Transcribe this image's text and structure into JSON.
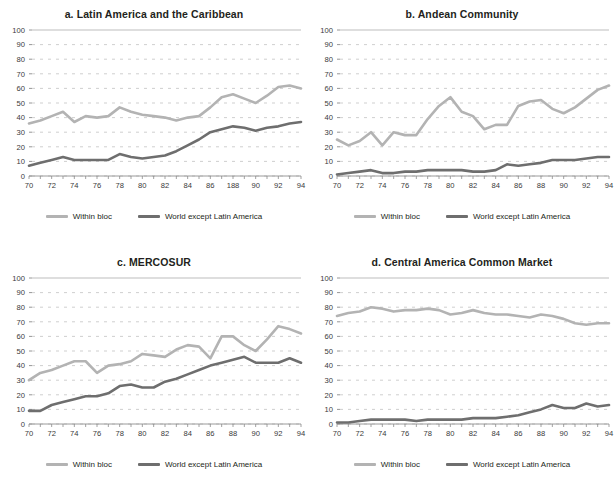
{
  "figure": {
    "background": "#ffffff",
    "series_colors": {
      "within_bloc": "#b3b3b3",
      "world_except": "#6e6e6e"
    },
    "grid_color": "#c9c9c9",
    "axis_color": "#9a9a9a",
    "legend": {
      "within_bloc_label": "Within bloc",
      "world_except_label": "World except Latin America"
    },
    "x_tick_labels": [
      "70",
      "72",
      "74",
      "76",
      "78",
      "80",
      "82",
      "84",
      "86",
      "188",
      "90",
      "92",
      "94"
    ],
    "x_tick_labels_standard": [
      "70",
      "72",
      "74",
      "76",
      "78",
      "80",
      "82",
      "84",
      "86",
      "88",
      "90",
      "92",
      "94"
    ],
    "y_tick_labels": [
      "0",
      "10",
      "20",
      "30",
      "40",
      "50",
      "60",
      "70",
      "80",
      "90",
      "100"
    ]
  },
  "chart_data": [
    {
      "id": "a",
      "type": "line",
      "title": "a. Latin America and the Caribbean",
      "xlabel": "",
      "ylabel": "",
      "xlim": [
        70,
        94
      ],
      "ylim": [
        0,
        100
      ],
      "grid": true,
      "legend_position": "bottom",
      "x": [
        70,
        71,
        72,
        73,
        74,
        75,
        76,
        77,
        78,
        79,
        80,
        81,
        82,
        83,
        84,
        85,
        86,
        87,
        88,
        89,
        90,
        91,
        92,
        93,
        94
      ],
      "tick_labels": [
        "70",
        "72",
        "74",
        "76",
        "78",
        "80",
        "82",
        "84",
        "86",
        "188",
        "90",
        "92",
        "94"
      ],
      "series": [
        {
          "name": "Within bloc",
          "color": "#b3b3b3",
          "values": [
            36,
            38,
            41,
            44,
            37,
            41,
            40,
            41,
            47,
            44,
            42,
            41,
            40,
            38,
            40,
            41,
            47,
            54,
            56,
            53,
            50,
            55,
            61,
            62,
            60
          ]
        },
        {
          "name": "World except Latin America",
          "color": "#6e6e6e",
          "values": [
            7,
            9,
            11,
            13,
            11,
            11,
            11,
            11,
            15,
            13,
            12,
            13,
            14,
            17,
            21,
            25,
            30,
            32,
            34,
            33,
            31,
            33,
            34,
            36,
            37
          ]
        }
      ]
    },
    {
      "id": "b",
      "type": "line",
      "title": "b. Andean Community",
      "xlabel": "",
      "ylabel": "",
      "xlim": [
        70,
        94
      ],
      "ylim": [
        0,
        100
      ],
      "grid": true,
      "legend_position": "bottom",
      "x": [
        70,
        71,
        72,
        73,
        74,
        75,
        76,
        77,
        78,
        79,
        80,
        81,
        82,
        83,
        84,
        85,
        86,
        87,
        88,
        89,
        90,
        91,
        92,
        93,
        94
      ],
      "tick_labels": [
        "70",
        "72",
        "74",
        "76",
        "78",
        "80",
        "82",
        "84",
        "86",
        "88",
        "90",
        "92",
        "94"
      ],
      "series": [
        {
          "name": "Within bloc",
          "color": "#b3b3b3",
          "values": [
            25,
            21,
            24,
            30,
            21,
            30,
            28,
            28,
            39,
            48,
            54,
            44,
            41,
            32,
            35,
            35,
            48,
            51,
            52,
            46,
            43,
            47,
            53,
            59,
            62
          ]
        },
        {
          "name": "World except Latin America",
          "color": "#6e6e6e",
          "values": [
            1,
            2,
            3,
            4,
            2,
            2,
            3,
            3,
            4,
            4,
            4,
            4,
            3,
            3,
            4,
            8,
            7,
            8,
            9,
            11,
            11,
            11,
            12,
            13,
            13
          ]
        }
      ]
    },
    {
      "id": "c",
      "type": "line",
      "title": "c. MERCOSUR",
      "xlabel": "",
      "ylabel": "",
      "xlim": [
        70,
        94
      ],
      "ylim": [
        0,
        100
      ],
      "grid": true,
      "legend_position": "bottom",
      "x": [
        70,
        71,
        72,
        73,
        74,
        75,
        76,
        77,
        78,
        79,
        80,
        81,
        82,
        83,
        84,
        85,
        86,
        87,
        88,
        89,
        90,
        91,
        92,
        93,
        94
      ],
      "tick_labels": [
        "70",
        "72",
        "74",
        "76",
        "78",
        "80",
        "82",
        "84",
        "86",
        "88",
        "90",
        "92",
        "94"
      ],
      "series": [
        {
          "name": "Within bloc",
          "color": "#b3b3b3",
          "values": [
            30,
            35,
            37,
            40,
            43,
            43,
            35,
            40,
            41,
            43,
            48,
            47,
            46,
            51,
            54,
            53,
            45,
            60,
            60,
            54,
            50,
            58,
            67,
            65,
            62
          ]
        },
        {
          "name": "World except Latin America",
          "color": "#6e6e6e",
          "values": [
            9,
            9,
            13,
            15,
            17,
            19,
            19,
            21,
            26,
            27,
            25,
            25,
            29,
            31,
            34,
            37,
            40,
            42,
            44,
            46,
            42,
            42,
            42,
            45,
            42
          ]
        }
      ]
    },
    {
      "id": "d",
      "type": "line",
      "title": "d. Central America Common Market",
      "xlabel": "",
      "ylabel": "",
      "xlim": [
        70,
        94
      ],
      "ylim": [
        0,
        100
      ],
      "grid": true,
      "legend_position": "bottom",
      "x": [
        70,
        71,
        72,
        73,
        74,
        75,
        76,
        77,
        78,
        79,
        80,
        81,
        82,
        83,
        84,
        85,
        86,
        87,
        88,
        89,
        90,
        91,
        92,
        93,
        94
      ],
      "tick_labels": [
        "70",
        "72",
        "74",
        "76",
        "78",
        "80",
        "82",
        "84",
        "86",
        "88",
        "90",
        "92",
        "94"
      ],
      "series": [
        {
          "name": "Within bloc",
          "color": "#b3b3b3",
          "values": [
            74,
            76,
            77,
            80,
            79,
            77,
            78,
            78,
            79,
            78,
            75,
            76,
            78,
            76,
            75,
            75,
            74,
            73,
            75,
            74,
            72,
            69,
            68,
            69,
            69
          ]
        },
        {
          "name": "World except Latin America",
          "color": "#6e6e6e",
          "values": [
            1,
            1,
            2,
            3,
            3,
            3,
            3,
            2,
            3,
            3,
            3,
            3,
            4,
            4,
            4,
            5,
            6,
            8,
            10,
            13,
            11,
            11,
            14,
            12,
            13
          ]
        }
      ]
    }
  ]
}
